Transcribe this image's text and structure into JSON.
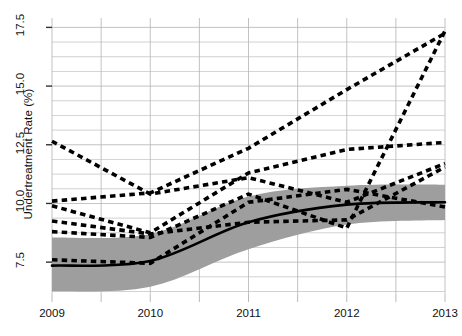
{
  "chart_data": {
    "type": "line",
    "title": "",
    "xlabel": "",
    "ylabel": "Undertreatment Rate (%)",
    "x": [
      2009,
      2010,
      2011,
      2012,
      2013
    ],
    "xlim": [
      2009,
      2013
    ],
    "ylim": [
      6.1,
      17.9
    ],
    "yticks": [
      7.5,
      10.0,
      12.5,
      15.0,
      17.5
    ],
    "ytick_labels": [
      "7.5",
      "10.0",
      "12.5",
      "15.0",
      "17.5"
    ],
    "xtick_labels": [
      "2009",
      "2010",
      "2011",
      "2012",
      "2013"
    ],
    "minor_gridlines": true,
    "minor_y_step": 0.625,
    "minor_x_step": 0.5,
    "grid": "on",
    "legend": "none",
    "series": [
      {
        "name": "trend-line",
        "style": "solid",
        "color": "#000000",
        "values": [
          7.35,
          7.55,
          9.2,
          9.95,
          10.05
        ]
      },
      {
        "name": "confidence-band-upper",
        "style": "band",
        "color": "#9e9e9e",
        "values": [
          8.55,
          8.7,
          10.3,
          10.75,
          10.8
        ]
      },
      {
        "name": "confidence-band-lower",
        "style": "band",
        "color": "#9e9e9e",
        "values": [
          6.25,
          6.45,
          8.05,
          9.1,
          9.3
        ]
      },
      {
        "name": "series-a",
        "style": "dashed",
        "color": "#000000",
        "values": [
          12.65,
          10.4,
          11.1,
          10.05,
          11.7
        ]
      },
      {
        "name": "series-b",
        "style": "dashed",
        "color": "#000000",
        "values": [
          10.1,
          10.45,
          12.35,
          14.85,
          17.25
        ]
      },
      {
        "name": "series-c",
        "style": "dashed",
        "color": "#000000",
        "values": [
          9.9,
          8.75,
          11.3,
          12.3,
          12.6
        ]
      },
      {
        "name": "series-d",
        "style": "dashed",
        "color": "#000000",
        "values": [
          9.25,
          8.7,
          9.2,
          9.3,
          11.55
        ]
      },
      {
        "name": "series-e",
        "style": "dashed",
        "color": "#000000",
        "values": [
          8.8,
          8.55,
          10.4,
          8.95,
          17.35
        ]
      },
      {
        "name": "series-f",
        "style": "dashed",
        "color": "#000000",
        "values": [
          7.6,
          7.45,
          10.05,
          10.6,
          9.85
        ]
      }
    ]
  },
  "axes": {
    "y_title": "Undertreatment Rate (%)"
  },
  "colors": {
    "band": "#9e9e9e",
    "line": "#000000",
    "grid": "#b9b9b9",
    "text": "#111111",
    "background": "#ffffff"
  }
}
